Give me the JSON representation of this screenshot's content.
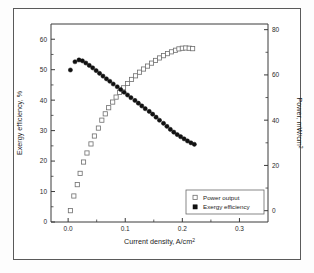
{
  "figure": {
    "background": "#ffffff",
    "border_color": "#5a5a5a"
  },
  "chart_data": {
    "type": "scatter",
    "title": "",
    "xlabel": "Current density, A/cm",
    "xlabel_sup": "2",
    "ylabel_left": "Exergy efficiency, %",
    "ylabel_right": "Power, mW/cm",
    "ylabel_right_sup": "2",
    "xlim": [
      -0.03,
      0.35
    ],
    "ylim_left": [
      0,
      65
    ],
    "ylim_right": [
      -5,
      82.5
    ],
    "xticks": [
      0.0,
      0.1,
      0.2,
      0.3
    ],
    "xtick_labels": [
      "0.0",
      "0.1",
      "0.2",
      "0.3"
    ],
    "yticks_left": [
      0,
      10,
      20,
      30,
      40,
      50,
      60
    ],
    "ytick_labels_left": [
      "0",
      "10",
      "20",
      "30",
      "40",
      "50",
      "60"
    ],
    "yticks_right": [
      0,
      20,
      40,
      60,
      80
    ],
    "ytick_labels_right": [
      "0",
      "20",
      "40",
      "60",
      "80"
    ],
    "grid": false,
    "legend_position": "lower-right",
    "series": [
      {
        "name": "Power output",
        "marker": "open-square",
        "marker_color": "#ffffff",
        "marker_edge": "#6e6e6e",
        "axis": "right",
        "x": [
          0.004,
          0.01,
          0.016,
          0.021,
          0.027,
          0.033,
          0.04,
          0.046,
          0.053,
          0.059,
          0.065,
          0.071,
          0.078,
          0.084,
          0.09,
          0.097,
          0.104,
          0.111,
          0.118,
          0.125,
          0.132,
          0.139,
          0.146,
          0.153,
          0.16,
          0.167,
          0.174,
          0.181,
          0.188,
          0.194,
          0.2,
          0.206,
          0.212,
          0.218
        ],
        "y": [
          0.0,
          6.5,
          11.5,
          16.5,
          21.5,
          25.5,
          29.5,
          33.0,
          36.5,
          40.0,
          42.8,
          45.5,
          48.0,
          50.2,
          52.3,
          54.3,
          56.2,
          58.0,
          59.6,
          61.2,
          62.6,
          63.9,
          65.2,
          66.4,
          67.5,
          68.5,
          69.4,
          70.2,
          70.9,
          71.5,
          71.8,
          71.9,
          71.8,
          71.6
        ]
      },
      {
        "name": "Exergy efficiency",
        "marker": "filled-circle",
        "marker_color": "#111111",
        "axis": "left",
        "x": [
          0.004,
          0.012,
          0.019,
          0.025,
          0.031,
          0.037,
          0.043,
          0.049,
          0.055,
          0.061,
          0.067,
          0.073,
          0.079,
          0.086,
          0.092,
          0.098,
          0.104,
          0.11,
          0.117,
          0.123,
          0.129,
          0.135,
          0.142,
          0.148,
          0.154,
          0.16,
          0.167,
          0.173,
          0.179,
          0.185,
          0.191,
          0.197,
          0.203,
          0.209,
          0.215,
          0.221
        ],
        "y": [
          49.9,
          52.6,
          53.2,
          52.9,
          52.2,
          51.4,
          50.6,
          49.7,
          48.8,
          47.9,
          47.0,
          46.2,
          45.3,
          44.4,
          43.5,
          42.6,
          41.7,
          40.8,
          39.9,
          39.0,
          38.1,
          37.2,
          36.3,
          35.4,
          34.4,
          33.4,
          32.4,
          31.4,
          30.4,
          29.5,
          28.7,
          28.0,
          27.3,
          26.6,
          26.0,
          25.5
        ]
      }
    ],
    "legend_entries": [
      {
        "label": "Power output",
        "marker": "open-square"
      },
      {
        "label": "Exergy efficiency",
        "marker": "filled-square"
      }
    ]
  }
}
